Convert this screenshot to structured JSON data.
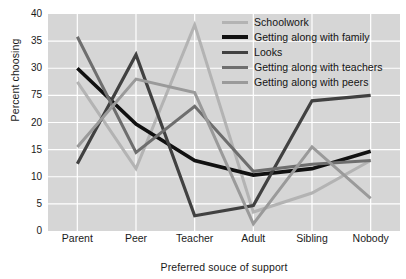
{
  "chart_data": {
    "type": "line",
    "title": "",
    "xlabel": "Preferred souce of support",
    "ylabel": "Percent choosing",
    "categories": [
      "Parent",
      "Peer",
      "Teacher",
      "Adult",
      "Sibling",
      "Nobody"
    ],
    "ylim": [
      0,
      40
    ],
    "yticks": [
      0,
      5,
      10,
      15,
      20,
      "75",
      30,
      35,
      40
    ],
    "ytick_labels": [
      "0",
      "5",
      "10",
      "15",
      "20",
      "75",
      "30",
      "35",
      "40"
    ],
    "grid": true,
    "legend_position": "top-right",
    "plot_background": "#d6d6d6",
    "series": [
      {
        "name": "Schoolwork",
        "color": "#b3b3b3",
        "values": [
          27.5,
          11.5,
          38.0,
          3.5,
          7.0,
          13.0
        ]
      },
      {
        "name": "Getting along with family",
        "color": "#111111",
        "values": [
          30.0,
          19.7,
          13.0,
          10.3,
          11.5,
          14.7
        ]
      },
      {
        "name": "Looks",
        "color": "#414141",
        "values": [
          12.4,
          32.5,
          2.8,
          4.7,
          24.0,
          25.0
        ]
      },
      {
        "name": "Getting along with teachers",
        "color": "#6e6e6e",
        "values": [
          35.8,
          14.5,
          23.0,
          11.0,
          12.3,
          13.0
        ]
      },
      {
        "name": "Getting along with peers",
        "color": "#9a9a9a",
        "values": [
          15.5,
          28.0,
          25.5,
          1.3,
          15.5,
          6.0
        ]
      }
    ]
  },
  "legend": {
    "items": [
      {
        "label": "Schoolwork",
        "color": "#b3b3b3",
        "width": 3
      },
      {
        "label": "Getting along with family",
        "color": "#111111",
        "width": 4
      },
      {
        "label": "Looks",
        "color": "#414141",
        "width": 3.5
      },
      {
        "label": "Getting along with teachers",
        "color": "#6e6e6e",
        "width": 3
      },
      {
        "label": "Getting along with peers",
        "color": "#9a9a9a",
        "width": 3
      }
    ]
  }
}
